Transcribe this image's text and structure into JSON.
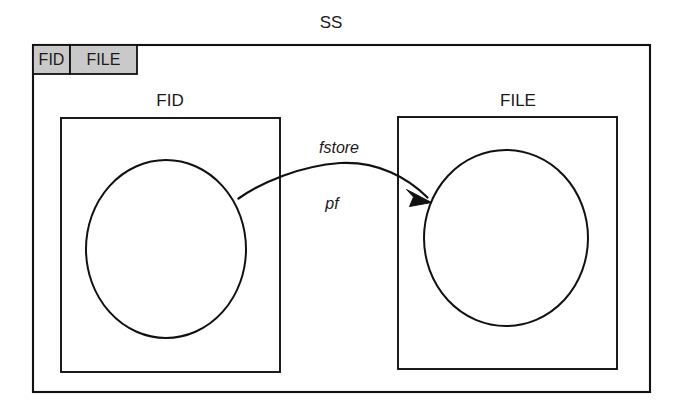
{
  "diagram": {
    "title": "SS",
    "type": "schema-state-space-diagram",
    "tabs": [
      {
        "label": "FID"
      },
      {
        "label": "FILE"
      }
    ],
    "boxes": [
      {
        "id": "fid",
        "label": "FID",
        "shape_name": "circle",
        "shape_label": ""
      },
      {
        "id": "file",
        "label": "FILE",
        "shape_name": "circle",
        "shape_label": ""
      }
    ],
    "edges": [
      {
        "id": "fstore",
        "from": "fid",
        "to": "file",
        "label_primary": "fstore",
        "label_secondary": "pf",
        "arrow": "open-to-filled-head",
        "direction": "fid-to-file"
      }
    ],
    "colors": {
      "stroke": "#111111",
      "background": "#ffffff",
      "tab_fill": "#c9c9c9",
      "box_fill": "#ffffff"
    }
  }
}
